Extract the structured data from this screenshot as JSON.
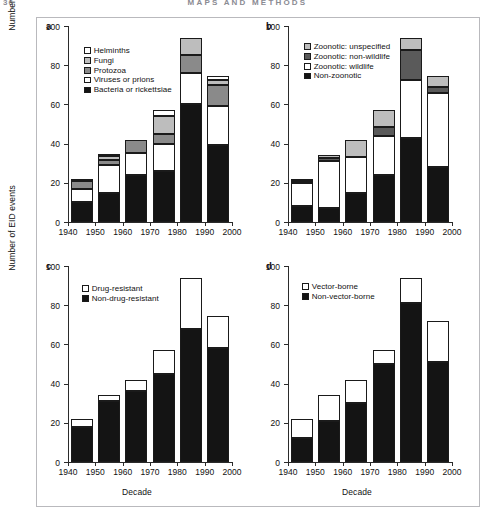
{
  "running_head": {
    "page_number": "36",
    "title": "MAPS AND METHODS"
  },
  "figure": {
    "ylabel": "Number of EID events",
    "xlabel": "Decade",
    "decades": [
      "1940",
      "1950",
      "1960",
      "1970",
      "1980",
      "1990",
      "2000"
    ],
    "bar_decades": [
      "1940",
      "1950",
      "1960",
      "1970",
      "1980",
      "1990"
    ],
    "yticks": [
      "0",
      "20",
      "40",
      "60",
      "80",
      "100"
    ],
    "ylim": [
      0,
      100
    ]
  },
  "colors": {
    "white": "#ffffff",
    "light_gray": "#bdbdbd",
    "mid_gray": "#8a8a8a",
    "dark_gray": "#5a5a5a",
    "black": "#141414",
    "outline": "#1a1a1a"
  },
  "chart_data": [
    {
      "panel": "a",
      "type": "bar",
      "stacked": true,
      "title": "",
      "xlabel": "Decade",
      "ylabel": "Number of EID events",
      "ylim": [
        0,
        100
      ],
      "grid": false,
      "legend_position": "upper-left",
      "categories": [
        "1940",
        "1950",
        "1960",
        "1970",
        "1980",
        "1990"
      ],
      "series": [
        {
          "name": "Bacteria or rickettsiae",
          "color": "#141414",
          "values": [
            10,
            15,
            24,
            26,
            60,
            39.5
          ]
        },
        {
          "name": "Viruses or prions",
          "color": "#ffffff",
          "values": [
            7,
            14,
            11,
            14,
            16,
            19.5
          ]
        },
        {
          "name": "Protozoa",
          "color": "#8a8a8a",
          "values": [
            4,
            2.5,
            7,
            5,
            9,
            11
          ]
        },
        {
          "name": "Fungi",
          "color": "#bdbdbd",
          "values": [
            1,
            2,
            0,
            9,
            9,
            2.5
          ]
        },
        {
          "name": "Helminths",
          "color": "#ffffff",
          "values": [
            0,
            0.5,
            0,
            3,
            0,
            2
          ]
        }
      ],
      "totals": [
        22,
        34,
        42,
        57,
        94,
        74.5
      ]
    },
    {
      "panel": "b",
      "type": "bar",
      "stacked": true,
      "title": "",
      "xlabel": "Decade",
      "ylabel": "Number of EID events",
      "ylim": [
        0,
        100
      ],
      "grid": false,
      "legend_position": "upper-left",
      "categories": [
        "1940",
        "1950",
        "1960",
        "1970",
        "1980",
        "1990"
      ],
      "series": [
        {
          "name": "Non-zoonotic",
          "color": "#141414",
          "values": [
            8,
            7,
            15,
            24,
            43,
            28
          ]
        },
        {
          "name": "Zoonotic: wildlife",
          "color": "#ffffff",
          "values": [
            12,
            24,
            18,
            20,
            29.5,
            38
          ]
        },
        {
          "name": "Zoonotic: non-wildlife",
          "color": "#5a5a5a",
          "values": [
            1,
            1.5,
            0,
            4.5,
            15.5,
            3
          ]
        },
        {
          "name": "Zoonotic: unspecified",
          "color": "#bdbdbd",
          "values": [
            1,
            1.5,
            9,
            8.5,
            6,
            5.5
          ]
        }
      ],
      "totals": [
        22,
        34,
        42,
        57,
        94,
        74.5
      ]
    },
    {
      "panel": "c",
      "type": "bar",
      "stacked": true,
      "title": "",
      "xlabel": "Decade",
      "ylabel": "Number of EID events",
      "ylim": [
        0,
        100
      ],
      "grid": false,
      "legend_position": "upper-left",
      "categories": [
        "1940",
        "1950",
        "1960",
        "1970",
        "1980",
        "1990"
      ],
      "series": [
        {
          "name": "Non-drug-resistant",
          "color": "#141414",
          "values": [
            18,
            31,
            36,
            45,
            68,
            58
          ]
        },
        {
          "name": "Drug-resistant",
          "color": "#ffffff",
          "values": [
            4,
            3,
            6,
            12,
            26,
            16.5
          ]
        }
      ],
      "totals": [
        22,
        34,
        42,
        57,
        94,
        74.5
      ]
    },
    {
      "panel": "d",
      "type": "bar",
      "stacked": true,
      "title": "",
      "xlabel": "Decade",
      "ylabel": "Number of EID events",
      "ylim": [
        0,
        100
      ],
      "grid": false,
      "legend_position": "upper-left",
      "categories": [
        "1940",
        "1950",
        "1960",
        "1970",
        "1980",
        "1990"
      ],
      "series": [
        {
          "name": "Non-vector-borne",
          "color": "#141414",
          "values": [
            12,
            21,
            30,
            50,
            81,
            51
          ]
        },
        {
          "name": "Vector-borne",
          "color": "#ffffff",
          "values": [
            10,
            13,
            12,
            7,
            13,
            21
          ]
        }
      ],
      "totals": [
        22,
        34,
        42,
        57,
        94,
        72
      ]
    }
  ],
  "panels": {
    "a": {
      "letter": "a",
      "legend": [
        "Helminths",
        "Fungi",
        "Protozoa",
        "Viruses or prions",
        "Bacteria or rickettsiae"
      ]
    },
    "b": {
      "letter": "b",
      "legend": [
        "Zoonotic: unspecified",
        "Zoonotic: non-wildlife",
        "Zoonotic: wildlife",
        "Non-zoonotic"
      ]
    },
    "c": {
      "letter": "c",
      "legend": [
        "Drug-resistant",
        "Non-drug-resistant"
      ]
    },
    "d": {
      "letter": "d",
      "legend": [
        "Vector-borne",
        "Non-vector-borne"
      ]
    }
  }
}
